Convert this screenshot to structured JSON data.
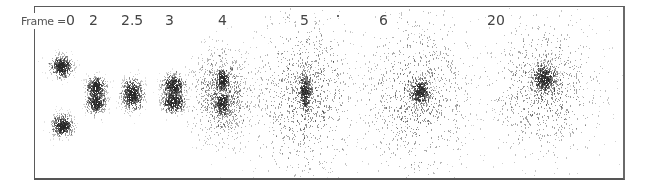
{
  "figure": {
    "label_prefix": "Frame =",
    "frames": [
      {
        "label": "0",
        "label_x": 60,
        "blobs": [
          {
            "cx": 61,
            "cy": 66,
            "rx": 7,
            "ry": 7,
            "density": 0.85,
            "halo": 1.6
          },
          {
            "cx": 62,
            "cy": 125,
            "rx": 7,
            "ry": 7,
            "density": 0.85,
            "halo": 1.6
          }
        ]
      },
      {
        "label": "2",
        "label_x": 93,
        "blobs": [
          {
            "cx": 96,
            "cy": 87,
            "rx": 6,
            "ry": 7,
            "density": 0.8,
            "halo": 1.7
          },
          {
            "cx": 96,
            "cy": 102,
            "rx": 6,
            "ry": 7,
            "density": 0.8,
            "halo": 1.7
          }
        ]
      },
      {
        "label": "2.5",
        "label_x": 122,
        "blobs": [
          {
            "cx": 132,
            "cy": 94,
            "rx": 7,
            "ry": 10,
            "density": 0.8,
            "halo": 1.6
          }
        ]
      },
      {
        "label": "3",
        "label_x": 168,
        "blobs": [
          {
            "cx": 173,
            "cy": 85,
            "rx": 7,
            "ry": 7,
            "density": 0.8,
            "halo": 1.7
          },
          {
            "cx": 173,
            "cy": 101,
            "rx": 7,
            "ry": 7,
            "density": 0.8,
            "halo": 1.7
          }
        ]
      },
      {
        "label": "4",
        "label_x": 220,
        "blobs": [
          {
            "cx": 222,
            "cy": 80,
            "rx": 5,
            "ry": 8,
            "density": 0.75,
            "halo": 1.4
          },
          {
            "cx": 222,
            "cy": 103,
            "rx": 5,
            "ry": 8,
            "density": 0.75,
            "halo": 1.4
          },
          {
            "cx": 222,
            "cy": 95,
            "rx": 24,
            "ry": 38,
            "density": 0.18,
            "halo": 1.2
          }
        ]
      },
      {
        "label": "5",
        "label_x": 302,
        "blobs": [
          {
            "cx": 305,
            "cy": 92,
            "rx": 5,
            "ry": 14,
            "density": 0.6,
            "halo": 1.4
          },
          {
            "cx": 305,
            "cy": 95,
            "rx": 42,
            "ry": 65,
            "density": 0.06,
            "halo": 1.2
          }
        ]
      },
      {
        "label": "6",
        "label_x": 381,
        "blobs": [
          {
            "cx": 420,
            "cy": 91,
            "rx": 7,
            "ry": 9,
            "density": 0.65,
            "halo": 1.6
          },
          {
            "cx": 418,
            "cy": 95,
            "rx": 45,
            "ry": 65,
            "density": 0.05,
            "halo": 1.2
          }
        ]
      },
      {
        "label": "20",
        "label_x": 488,
        "blobs": [
          {
            "cx": 544,
            "cy": 78,
            "rx": 8,
            "ry": 10,
            "density": 0.55,
            "halo": 1.7
          },
          {
            "cx": 544,
            "cy": 88,
            "rx": 45,
            "ry": 55,
            "density": 0.05,
            "halo": 1.25
          }
        ]
      }
    ],
    "stray_dot": {
      "x": 337,
      "y": 15
    }
  }
}
